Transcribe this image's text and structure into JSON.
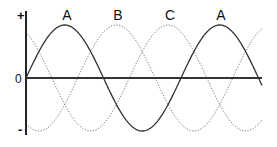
{
  "chart_data": {
    "type": "line",
    "title": "",
    "xlabel": "",
    "ylabel": "",
    "y_tick_labels": [
      "+",
      "0",
      "-"
    ],
    "ylim": [
      -1,
      1
    ],
    "x_range_periods": [
      0,
      1.52
    ],
    "phase_shift_degrees": 120,
    "grid": false,
    "legend": "inline labels above peaks",
    "peak_labels": [
      "A",
      "B",
      "C",
      "A"
    ],
    "series": [
      {
        "name": "A",
        "style": "solid",
        "function": "sin(x)",
        "phase_deg": 0
      },
      {
        "name": "B",
        "style": "dotted",
        "function": "sin(x - 120°)",
        "phase_deg": -120
      },
      {
        "name": "C",
        "style": "dotted",
        "function": "sin(x - 240°)",
        "phase_deg": -240
      }
    ]
  },
  "colors": {
    "axis": "#222222",
    "solid_line": "#333333",
    "dotted_line": "#777777",
    "background": "#ffffff"
  },
  "axis_labels": {
    "plus": "+",
    "zero": "0",
    "minus": "-"
  },
  "peak_labels": {
    "a1": "A",
    "b": "B",
    "c": "C",
    "a2": "A"
  }
}
